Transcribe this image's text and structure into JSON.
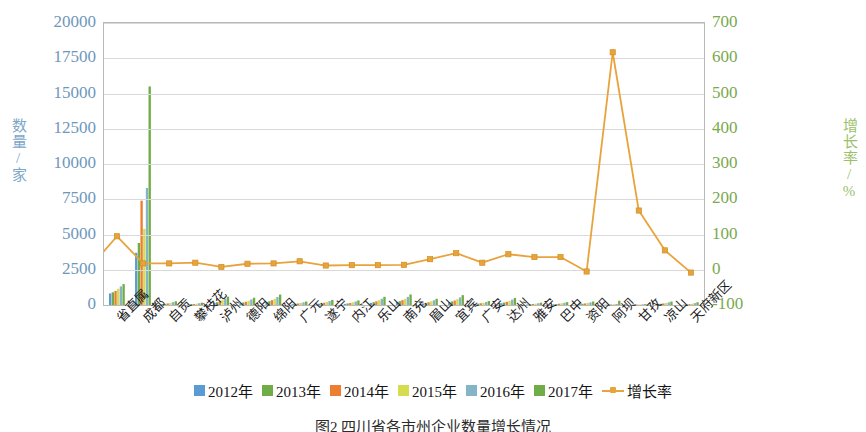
{
  "chart_data": {
    "type": "bar",
    "title": "",
    "caption": "图2  四川省各市州企业数量增长情况",
    "xlabel": "",
    "ylabel": "数量/家",
    "y2label": "增长率/%",
    "ylim": [
      0,
      20000
    ],
    "y2lim": [
      -100,
      700
    ],
    "yticks": [
      "0",
      "2500",
      "5000",
      "7500",
      "10000",
      "12500",
      "15000",
      "17500",
      "20000"
    ],
    "y2ticks": [
      "-100",
      "0",
      "100",
      "200",
      "300",
      "400",
      "500",
      "600",
      "700"
    ],
    "grid": true,
    "legend_position": "bottom",
    "categories": [
      "省直属",
      "成都",
      "自贡",
      "攀枝花",
      "泸州",
      "德阳",
      "绵阳",
      "广元",
      "遂宁",
      "内江",
      "乐山",
      "南充",
      "眉山",
      "宜宾",
      "广安",
      "达州",
      "雅安",
      "巴中",
      "资阳",
      "阿坝",
      "甘孜",
      "凉山",
      "天府新区"
    ],
    "series": [
      {
        "name": "2012年",
        "color": "#5b9bd5",
        "values": [
          820,
          3700,
          60,
          40,
          150,
          130,
          210,
          60,
          90,
          80,
          150,
          210,
          110,
          190,
          70,
          130,
          40,
          50,
          60,
          20,
          15,
          60,
          30
        ]
      },
      {
        "name": "2013年",
        "color": "#70ad47",
        "values": [
          900,
          4400,
          80,
          55,
          200,
          180,
          270,
          85,
          120,
          110,
          200,
          270,
          150,
          250,
          95,
          175,
          55,
          70,
          85,
          28,
          20,
          85,
          45
        ]
      },
      {
        "name": "2014年",
        "color": "#ed7d31",
        "values": [
          1000,
          7400,
          110,
          70,
          260,
          230,
          340,
          110,
          160,
          145,
          260,
          345,
          195,
          320,
          125,
          225,
          72,
          92,
          110,
          38,
          27,
          110,
          62
        ]
      },
      {
        "name": "2015年",
        "color": "#d5dc50",
        "values": [
          1150,
          5400,
          150,
          95,
          340,
          300,
          440,
          145,
          210,
          190,
          340,
          440,
          255,
          415,
          165,
          295,
          95,
          120,
          145,
          52,
          36,
          145,
          88
        ]
      },
      {
        "name": "2016年",
        "color": "#84b5c6",
        "values": [
          1320,
          8300,
          200,
          125,
          450,
          395,
          570,
          190,
          275,
          250,
          445,
          575,
          335,
          540,
          215,
          385,
          125,
          158,
          190,
          75,
          48,
          190,
          130
        ]
      },
      {
        "name": "2017年",
        "color": "#70ad47",
        "values": [
          1480,
          15500,
          265,
          165,
          590,
          515,
          740,
          250,
          360,
          325,
          580,
          750,
          440,
          700,
          280,
          500,
          165,
          205,
          248,
          300,
          64,
          248,
          195
        ]
      }
    ],
    "line_series": {
      "name": "增长率",
      "color": "#e8a33d",
      "marker": "square",
      "axis": "secondary",
      "unit": "%",
      "values": [
        11,
        95,
        18,
        18,
        20,
        8,
        17,
        18,
        24,
        12,
        13,
        13,
        14,
        30,
        47,
        20,
        44,
        36,
        36,
        -5,
        617,
        168,
        55,
        -8
      ]
    },
    "line_values": [
      11,
      95,
      18,
      18,
      20,
      8,
      17,
      18,
      24,
      12,
      13,
      13,
      14,
      30,
      47,
      20,
      44,
      36,
      36,
      -5,
      617,
      168,
      55,
      -8
    ]
  },
  "legend": {
    "items": [
      {
        "label": "2012年",
        "color": "#5b9bd5",
        "type": "swatch"
      },
      {
        "label": "2013年",
        "color": "#70ad47",
        "type": "swatch"
      },
      {
        "label": "2014年",
        "color": "#ed7d31",
        "type": "swatch"
      },
      {
        "label": "2015年",
        "color": "#d5dc50",
        "type": "swatch"
      },
      {
        "label": "2016年",
        "color": "#84b5c6",
        "type": "swatch"
      },
      {
        "label": "2017年",
        "color": "#70ad47",
        "type": "swatch"
      },
      {
        "label": "增长率",
        "color": "#e8a33d",
        "type": "line"
      }
    ]
  },
  "colors": {
    "left_axis_text": "#6f97bb",
    "right_axis_text": "#7aa94e",
    "grid": "#d9d9d9",
    "plot_border": "#b9b9b9",
    "line": "#e8a33d"
  }
}
